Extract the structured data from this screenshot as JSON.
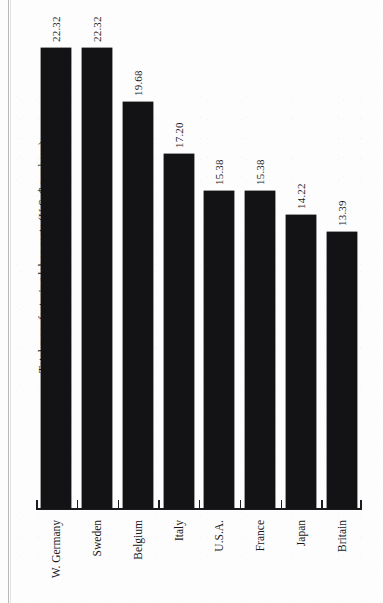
{
  "chart_data": {
    "type": "bar",
    "title": "",
    "subtitle": "",
    "xlabel": "",
    "ylabel": "Total manufacturing labor costs (U.S. $ per hour)",
    "orientation": "vertical-bars-rotated-page",
    "grid": false,
    "legend": null,
    "ylim": [
      0,
      24.5
    ],
    "categories": [
      "W. Germany",
      "Sweden",
      "Belgium",
      "Italy",
      "U.S.A.",
      "France",
      "Japan",
      "Britain"
    ],
    "values": [
      22.32,
      22.32,
      19.68,
      17.2,
      15.38,
      15.38,
      14.22,
      13.39
    ],
    "value_labels": [
      "22.32",
      "22.32",
      "19.68",
      "17.20",
      "15.38",
      "15.38",
      "14.22",
      "13.39"
    ],
    "bar_color": "#131316",
    "axis_color": "#1b1b1e",
    "background": "#fdfdfd"
  },
  "axis": {
    "title": "Total manufacturing labor costs (U.S. $ per hour)"
  }
}
